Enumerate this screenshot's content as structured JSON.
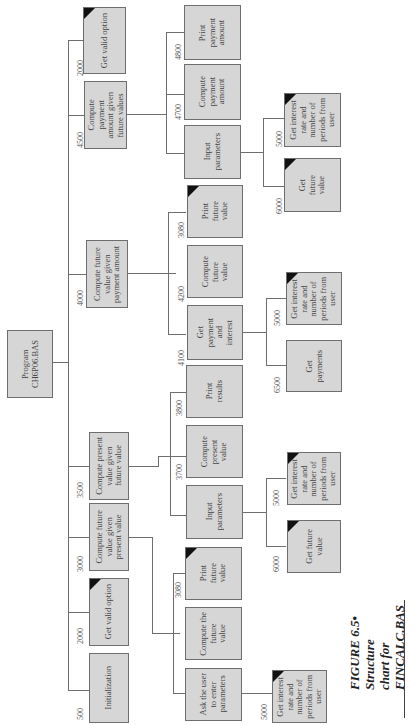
{
  "figure": {
    "number": "FIGURE 6.5•",
    "caption_line1": "Structure",
    "caption_line2": "chart for",
    "caption_line3": "FINCALC.BAS"
  },
  "root": {
    "label": "Program\nCH6P06.BAS"
  },
  "level1": [
    {
      "id": "500",
      "label": "Initialization",
      "predefined": false
    },
    {
      "id": "2000",
      "label": "Get valid option",
      "predefined": true
    },
    {
      "id": "3000",
      "label": "Compute future\nvalue given\npresent value",
      "predefined": false
    },
    {
      "id": "3500",
      "label": "Compute present\nvalue given\nfuture value",
      "predefined": false
    },
    {
      "id": "4000",
      "label": "Compute future\nvalue given\npayment amount",
      "predefined": false
    },
    {
      "id": "4500",
      "label": "Compute\npayment\namount given\nfuture values",
      "predefined": false
    },
    {
      "id": "2000",
      "label": "Get valid option",
      "predefined": true
    }
  ],
  "level2": {
    "fv_given_pv": [
      {
        "id": "",
        "label": "Ask the user\nto enter\nparameters",
        "predefined": false
      },
      {
        "id": "",
        "label": "Compute the\nfuture\nvalue",
        "predefined": false
      },
      {
        "id": "3080",
        "label": "Print\nfuture\nvalue",
        "predefined": true
      }
    ],
    "pv_given_fv": [
      {
        "id": "",
        "label": "Input\nparameters",
        "predefined": false
      },
      {
        "id": "3700",
        "label": "Compute\npresent\nvalue",
        "predefined": false
      },
      {
        "id": "3800",
        "label": "Print\nresults",
        "predefined": false
      }
    ],
    "fv_given_payment": [
      {
        "id": "4100",
        "label": "Get\npayment\nand\ninterest",
        "predefined": false
      },
      {
        "id": "4200",
        "label": "Compute\nfuture\nvalue",
        "predefined": false
      },
      {
        "id": "3080",
        "label": "Print\nfuture\nvalue",
        "predefined": true
      }
    ],
    "payment_given_fv": [
      {
        "id": "",
        "label": "Input\nparameters",
        "predefined": false
      },
      {
        "id": "4700",
        "label": "Compute\npayment\namount",
        "predefined": false
      },
      {
        "id": "4800",
        "label": "Print\npayment\namount",
        "predefined": false
      }
    ]
  },
  "level3": {
    "ask_user": [
      {
        "id": "5000",
        "label": "Get interest\nrate and\nnumber of\nperiods from\nuser",
        "predefined": true
      }
    ],
    "input_pv": [
      {
        "id": "6000",
        "label": "Get future\nvalue",
        "predefined": true
      },
      {
        "id": "5000",
        "label": "Get interest\nrate and\nnumber of\nperiods from\nuser",
        "predefined": true
      }
    ],
    "get_payment": [
      {
        "id": "6500",
        "label": "Get\npayments",
        "predefined": false
      },
      {
        "id": "5000",
        "label": "Get interest\nrate and\nnumber of\nperiods from\nuser",
        "predefined": true
      }
    ],
    "input_payment": [
      {
        "id": "6000",
        "label": "Get\nfuture\nvalue",
        "predefined": true
      },
      {
        "id": "5000",
        "label": "Get interest\nrate and\nnumber of\nperiods from\nuser",
        "predefined": true
      }
    ]
  }
}
